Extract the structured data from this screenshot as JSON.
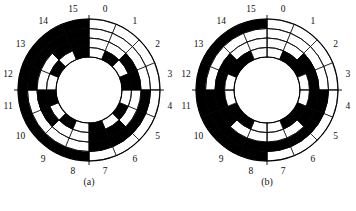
{
  "figure": {
    "panel_name": "binary-and-gray-code-encoder-discs",
    "background_color": "#ffffff",
    "ink_color": "#000000",
    "track_count": 4,
    "sector_count": 16,
    "sector_labels": [
      "0",
      "1",
      "2",
      "3",
      "4",
      "5",
      "6",
      "7",
      "8",
      "9",
      "10",
      "11",
      "12",
      "13",
      "14",
      "15"
    ],
    "geometry": {
      "center_x": 89,
      "center_y": 90,
      "outer_radius": 71,
      "inner_radius": 33,
      "ring_edges": [
        33,
        42.5,
        52,
        61.5,
        71
      ]
    }
  },
  "discs": [
    {
      "id": "disc-a",
      "caption": "(a)",
      "code_type": "natural binary",
      "track_order_outer_to_inner": [
        "bit3 (MSB)",
        "bit2",
        "bit1",
        "bit0 (LSB)"
      ],
      "codes": [
        {
          "sector": 0,
          "label": "0",
          "bits_outer_to_inner": [
            0,
            0,
            0,
            0
          ]
        },
        {
          "sector": 1,
          "label": "1",
          "bits_outer_to_inner": [
            0,
            0,
            0,
            1
          ]
        },
        {
          "sector": 2,
          "label": "2",
          "bits_outer_to_inner": [
            0,
            0,
            1,
            0
          ]
        },
        {
          "sector": 3,
          "label": "3",
          "bits_outer_to_inner": [
            0,
            0,
            1,
            1
          ]
        },
        {
          "sector": 4,
          "label": "4",
          "bits_outer_to_inner": [
            0,
            1,
            0,
            0
          ]
        },
        {
          "sector": 5,
          "label": "5",
          "bits_outer_to_inner": [
            0,
            1,
            0,
            1
          ]
        },
        {
          "sector": 6,
          "label": "6",
          "bits_outer_to_inner": [
            0,
            1,
            1,
            0
          ]
        },
        {
          "sector": 7,
          "label": "7",
          "bits_outer_to_inner": [
            0,
            1,
            1,
            1
          ]
        },
        {
          "sector": 8,
          "label": "8",
          "bits_outer_to_inner": [
            1,
            0,
            0,
            0
          ]
        },
        {
          "sector": 9,
          "label": "9",
          "bits_outer_to_inner": [
            1,
            0,
            0,
            1
          ]
        },
        {
          "sector": 10,
          "label": "10",
          "bits_outer_to_inner": [
            1,
            0,
            1,
            0
          ]
        },
        {
          "sector": 11,
          "label": "11",
          "bits_outer_to_inner": [
            1,
            0,
            1,
            1
          ]
        },
        {
          "sector": 12,
          "label": "12",
          "bits_outer_to_inner": [
            1,
            1,
            0,
            0
          ]
        },
        {
          "sector": 13,
          "label": "13",
          "bits_outer_to_inner": [
            1,
            1,
            0,
            1
          ]
        },
        {
          "sector": 14,
          "label": "14",
          "bits_outer_to_inner": [
            1,
            1,
            1,
            0
          ]
        },
        {
          "sector": 15,
          "label": "15",
          "bits_outer_to_inner": [
            1,
            1,
            1,
            1
          ]
        }
      ]
    },
    {
      "id": "disc-b",
      "caption": "(b)",
      "code_type": "Gray code",
      "track_order_outer_to_inner": [
        "bit3 (MSB)",
        "bit2",
        "bit1",
        "bit0 (LSB)"
      ],
      "codes": [
        {
          "sector": 0,
          "label": "0",
          "bits_outer_to_inner": [
            0,
            0,
            0,
            0
          ]
        },
        {
          "sector": 1,
          "label": "1",
          "bits_outer_to_inner": [
            0,
            0,
            0,
            1
          ]
        },
        {
          "sector": 2,
          "label": "2",
          "bits_outer_to_inner": [
            0,
            0,
            1,
            1
          ]
        },
        {
          "sector": 3,
          "label": "3",
          "bits_outer_to_inner": [
            0,
            0,
            1,
            0
          ]
        },
        {
          "sector": 4,
          "label": "4",
          "bits_outer_to_inner": [
            0,
            1,
            1,
            0
          ]
        },
        {
          "sector": 5,
          "label": "5",
          "bits_outer_to_inner": [
            0,
            1,
            1,
            1
          ]
        },
        {
          "sector": 6,
          "label": "6",
          "bits_outer_to_inner": [
            0,
            1,
            0,
            1
          ]
        },
        {
          "sector": 7,
          "label": "7",
          "bits_outer_to_inner": [
            0,
            1,
            0,
            0
          ]
        },
        {
          "sector": 8,
          "label": "8",
          "bits_outer_to_inner": [
            1,
            1,
            0,
            0
          ]
        },
        {
          "sector": 9,
          "label": "9",
          "bits_outer_to_inner": [
            1,
            1,
            0,
            1
          ]
        },
        {
          "sector": 10,
          "label": "10",
          "bits_outer_to_inner": [
            1,
            1,
            1,
            1
          ]
        },
        {
          "sector": 11,
          "label": "11",
          "bits_outer_to_inner": [
            1,
            1,
            1,
            0
          ]
        },
        {
          "sector": 12,
          "label": "12",
          "bits_outer_to_inner": [
            1,
            0,
            1,
            0
          ]
        },
        {
          "sector": 13,
          "label": "13",
          "bits_outer_to_inner": [
            1,
            0,
            1,
            1
          ]
        },
        {
          "sector": 14,
          "label": "14",
          "bits_outer_to_inner": [
            1,
            0,
            0,
            1
          ]
        },
        {
          "sector": 15,
          "label": "15",
          "bits_outer_to_inner": [
            1,
            0,
            0,
            0
          ]
        }
      ]
    }
  ]
}
